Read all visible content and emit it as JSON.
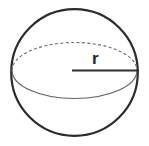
{
  "figure": {
    "name": "sphere-with-radius",
    "caption": "",
    "background_color": "#ffffff",
    "labels": {
      "radius": "r"
    },
    "colors": {
      "outline": "#2b2b2b",
      "equator_hidden": "#6e6e6e",
      "equator_visible": "#636363",
      "radius_line": "#2f2f2f",
      "label_text": "#272727"
    },
    "geometry": {
      "circle": {
        "cx": 74.5,
        "cy": 72.5,
        "r": 63.5,
        "stroke_width": 2.2,
        "style": "solid"
      },
      "equator_ellipse": {
        "cx": 74.5,
        "cy": 70.5,
        "rx": 62.5,
        "ry": 28.0,
        "upper_arc_style": "dashed",
        "lower_arc_style": "solid",
        "stroke_width": 1.1,
        "dash_pattern": "3 2.4"
      },
      "radius_line": {
        "x1": 72.0,
        "y1": 70.5,
        "x2": 139.0,
        "y2": 70.5,
        "stroke_width": 1.9
      },
      "label_position": {
        "x": 92,
        "y": 50
      }
    }
  }
}
